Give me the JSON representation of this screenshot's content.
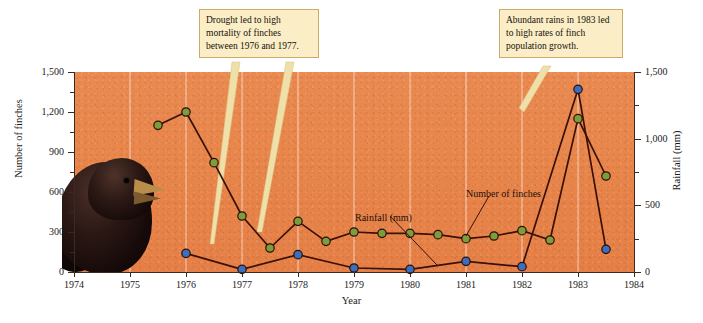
{
  "chart_data": {
    "type": "line",
    "title": "",
    "xlabel": "Year",
    "ylabel": "Number of finches",
    "y2label": "Rainfall (mm)",
    "xlim": [
      1974,
      1984
    ],
    "ylim": [
      0,
      1500
    ],
    "y2lim": [
      0,
      1500
    ],
    "grid": "vertical-only",
    "legend": "inline-annotations",
    "x_ticks": [
      "1974",
      "1975",
      "1976",
      "1977",
      "1978",
      "1979",
      "1980",
      "1981",
      "1982",
      "1983",
      "1984"
    ],
    "y_ticks": [
      "0",
      "300",
      "600",
      "900",
      "1,200",
      "1,500"
    ],
    "y2_ticks": [
      "0",
      "500",
      "1,000",
      "1,500"
    ],
    "y_minor_ticks": [
      150,
      450,
      750,
      1050,
      1350
    ],
    "y2_minor_ticks": [
      250,
      750,
      1250
    ],
    "series": [
      {
        "name": "Number of finches",
        "color": "#7d9c3b",
        "marker": "circle",
        "line_color": "#3a1008",
        "axis": "left",
        "points": [
          {
            "x": 1975.5,
            "y": 1100
          },
          {
            "x": 1976.0,
            "y": 1200
          },
          {
            "x": 1976.5,
            "y": 820
          },
          {
            "x": 1977.0,
            "y": 420
          },
          {
            "x": 1977.5,
            "y": 180
          },
          {
            "x": 1978.0,
            "y": 380
          },
          {
            "x": 1978.5,
            "y": 230
          },
          {
            "x": 1979.0,
            "y": 300
          },
          {
            "x": 1979.5,
            "y": 290
          },
          {
            "x": 1980.0,
            "y": 290
          },
          {
            "x": 1980.5,
            "y": 280
          },
          {
            "x": 1981.0,
            "y": 250
          },
          {
            "x": 1981.5,
            "y": 270
          },
          {
            "x": 1982.0,
            "y": 310
          },
          {
            "x": 1982.5,
            "y": 240
          },
          {
            "x": 1983.0,
            "y": 1150
          },
          {
            "x": 1983.5,
            "y": 720
          }
        ]
      },
      {
        "name": "Rainfall (mm)",
        "color": "#3b6fbd",
        "marker": "circle",
        "line_color": "#3a1008",
        "axis": "right",
        "points": [
          {
            "x": 1976.0,
            "y": 140
          },
          {
            "x": 1977.0,
            "y": 20
          },
          {
            "x": 1978.0,
            "y": 130
          },
          {
            "x": 1979.0,
            "y": 30
          },
          {
            "x": 1980.0,
            "y": 20
          },
          {
            "x": 1981.0,
            "y": 80
          },
          {
            "x": 1982.0,
            "y": 40
          },
          {
            "x": 1983.0,
            "y": 1370
          },
          {
            "x": 1983.5,
            "y": 170
          }
        ]
      }
    ],
    "annotations": [
      {
        "id": "drought",
        "text": "Drought led to high mortality of finches between 1976 and 1977.",
        "points_to": [
          "1976 finch point",
          "1977 finch point"
        ]
      },
      {
        "id": "rains",
        "text": "Abundant rains in 1983 led to high rates of finch population growth.",
        "points_to": [
          "1983 rainfall peak"
        ]
      }
    ],
    "inline_labels": [
      {
        "id": "rainfall-label",
        "text": "Rainfall (mm)"
      },
      {
        "id": "finches-label",
        "text": "Number of finches"
      }
    ],
    "photo": {
      "id": "finch-photo",
      "subject": "Darwin's ground finch"
    },
    "colors": {
      "panel_background": "#e8834a",
      "finch_marker": "#7d9c3b",
      "rainfall_marker": "#3b6fbd",
      "line": "#3a1008",
      "callout_fill": "#fbeec6",
      "callout_border": "#c9ab6a",
      "leader_line": "#e8d79a"
    }
  },
  "axes": {
    "y_title": "Number of finches",
    "y2_title": "Rainfall (mm)",
    "x_title": "Year"
  },
  "callouts": {
    "drought": "Drought led to high mortality of finches between 1976 and 1977.",
    "rains": "Abundant rains in 1983 led to high rates of finch population growth."
  },
  "labels": {
    "rainfall": "Rainfall (mm)",
    "finches": "Number of finches"
  }
}
